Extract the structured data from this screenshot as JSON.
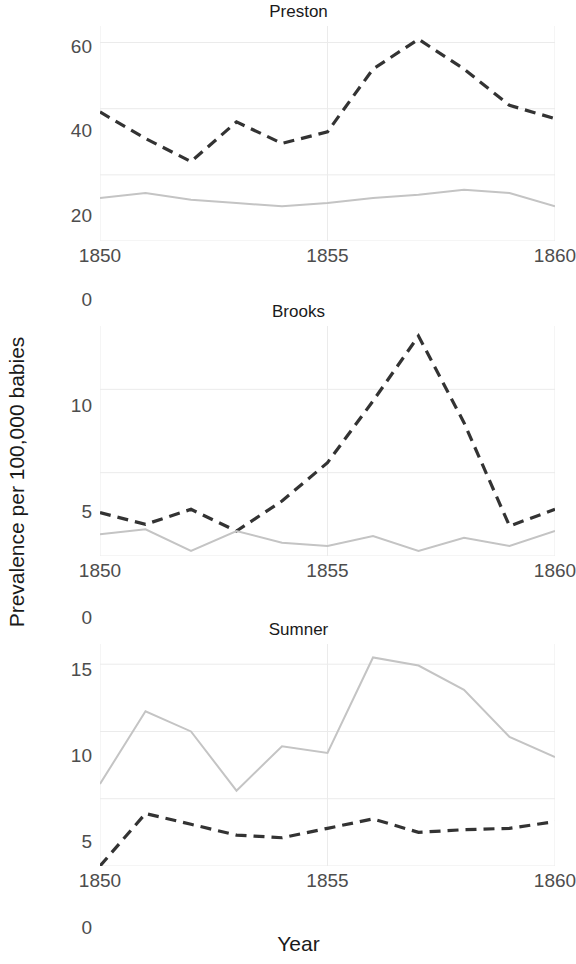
{
  "axes": {
    "ylabel": "Prevalence per 100,000 babies",
    "xlabel": "Year"
  },
  "panels": [
    {
      "key": "preston",
      "title": "Preston",
      "yticks": [
        "0",
        "20",
        "40",
        "60"
      ],
      "xticks": [
        "1850",
        "1855",
        "1860"
      ]
    },
    {
      "key": "brooks",
      "title": "Brooks",
      "yticks": [
        "0",
        "5",
        "10"
      ],
      "xticks": [
        "1850",
        "1855",
        "1860"
      ]
    },
    {
      "key": "sumner",
      "title": "Sumner",
      "yticks": [
        "0",
        "5",
        "10",
        "15"
      ],
      "xticks": [
        "1850",
        "1855",
        "1860"
      ]
    }
  ],
  "chart_data": [
    {
      "type": "line",
      "title": "Preston",
      "xlabel": "Year",
      "ylabel": "Prevalence per 100,000 babies",
      "x": [
        1850,
        1851,
        1852,
        1853,
        1854,
        1855,
        1856,
        1857,
        1858,
        1859,
        1860
      ],
      "xlim": [
        1850,
        1860
      ],
      "ylim": [
        0,
        65
      ],
      "yticks": [
        0,
        20,
        40,
        60
      ],
      "xticks": [
        1850,
        1855,
        1860
      ],
      "grid": true,
      "legend": "none",
      "series": [
        {
          "name": "dashed",
          "style": "dashed",
          "color": "#333333",
          "values": [
            39.0,
            31.0,
            24.0,
            36.0,
            29.5,
            33.0,
            52.0,
            61.0,
            52.0,
            41.0,
            37.0
          ]
        },
        {
          "name": "solid",
          "style": "solid",
          "color": "#c4c4c4",
          "values": [
            13.0,
            14.5,
            12.5,
            11.5,
            10.5,
            11.5,
            13.0,
            14.0,
            15.5,
            14.5,
            10.5
          ]
        }
      ]
    },
    {
      "type": "line",
      "title": "Brooks",
      "xlabel": "Year",
      "ylabel": "Prevalence per 100,000 babies",
      "x": [
        1850,
        1851,
        1852,
        1853,
        1854,
        1855,
        1856,
        1857,
        1858,
        1859,
        1860
      ],
      "xlim": [
        1850,
        1860
      ],
      "ylim": [
        0,
        13.8
      ],
      "yticks": [
        0,
        5,
        10
      ],
      "xticks": [
        1850,
        1855,
        1860
      ],
      "grid": true,
      "legend": "none",
      "series": [
        {
          "name": "dashed",
          "style": "dashed",
          "color": "#333333",
          "values": [
            2.6,
            1.9,
            2.8,
            1.5,
            3.3,
            5.6,
            9.3,
            13.2,
            8.0,
            1.8,
            2.8
          ]
        },
        {
          "name": "solid",
          "style": "solid",
          "color": "#c4c4c4",
          "values": [
            1.3,
            1.6,
            0.3,
            1.5,
            0.8,
            0.6,
            1.2,
            0.3,
            1.1,
            0.6,
            1.5
          ]
        }
      ]
    },
    {
      "type": "line",
      "title": "Sumner",
      "xlabel": "Year",
      "ylabel": "Prevalence per 100,000 babies",
      "x": [
        1850,
        1851,
        1852,
        1853,
        1854,
        1855,
        1856,
        1857,
        1858,
        1859,
        1860
      ],
      "xlim": [
        1850,
        1860
      ],
      "ylim": [
        0,
        16.5
      ],
      "yticks": [
        0,
        5,
        10,
        15
      ],
      "xticks": [
        1850,
        1855,
        1860
      ],
      "grid": true,
      "legend": "none",
      "series": [
        {
          "name": "solid",
          "style": "solid",
          "color": "#c4c4c4",
          "values": [
            6.1,
            11.5,
            10.0,
            5.6,
            8.9,
            8.4,
            15.5,
            14.9,
            13.1,
            9.6,
            8.1
          ]
        },
        {
          "name": "dashed",
          "style": "dashed",
          "color": "#333333",
          "values": [
            0.0,
            3.9,
            3.1,
            2.3,
            2.1,
            2.8,
            3.5,
            2.5,
            2.7,
            2.8,
            3.3
          ]
        }
      ]
    }
  ]
}
